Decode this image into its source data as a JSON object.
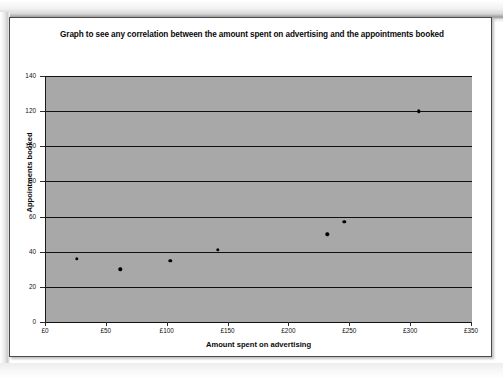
{
  "chart_data": {
    "type": "scatter",
    "title": "Graph to see any correlation between the amount spent on advertising and the appointments booked",
    "xlabel": "Amount spent on advertising",
    "ylabel": "Appointments booked",
    "xlim": [
      0,
      350
    ],
    "ylim": [
      0,
      140
    ],
    "xticks": [
      0,
      50,
      100,
      150,
      200,
      250,
      300,
      350
    ],
    "xtick_labels": [
      "£0",
      "£50",
      "£100",
      "£150",
      "£200",
      "£250",
      "£300",
      "£350"
    ],
    "yticks": [
      0,
      20,
      40,
      60,
      80,
      100,
      120,
      140
    ],
    "ytick_labels": [
      "0",
      "20",
      "40",
      "60",
      "80",
      "100",
      "120",
      "140"
    ],
    "grid": "horizontal",
    "legend": "none",
    "plot_background": "#a8a8a8",
    "marker_color": "#000000",
    "points": [
      {
        "x": 26,
        "y": 36
      },
      {
        "x": 62,
        "y": 30
      },
      {
        "x": 103,
        "y": 35
      },
      {
        "x": 142,
        "y": 41
      },
      {
        "x": 232,
        "y": 50
      },
      {
        "x": 246,
        "y": 57
      },
      {
        "x": 307,
        "y": 120
      }
    ]
  }
}
